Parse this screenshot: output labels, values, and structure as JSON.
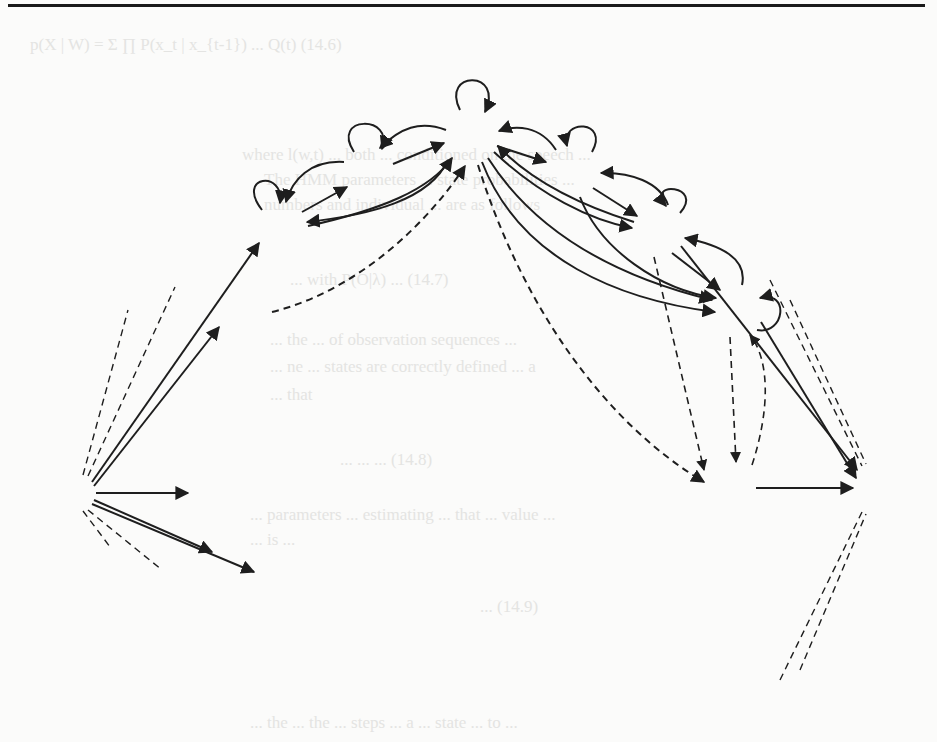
{
  "figure": {
    "nodes": [
      {
        "id": "qI",
        "label": "q",
        "sub": "I",
        "kind": "initial",
        "cx": 70,
        "cy": 493,
        "r": 22
      },
      {
        "id": "xk-1",
        "label": "x",
        "sub": "k-1",
        "kind": "state",
        "cx": 282,
        "cy": 228,
        "r": 26
      },
      {
        "id": "xk",
        "label": "x",
        "sub": "k",
        "kind": "state",
        "cx": 369,
        "cy": 172,
        "r": 26
      },
      {
        "id": "x1",
        "label": "x",
        "sub": "1",
        "kind": "state",
        "cx": 472,
        "cy": 137,
        "r": 27
      },
      {
        "id": "x2",
        "label": "x",
        "sub": "2",
        "kind": "state",
        "cx": 574,
        "cy": 172,
        "r": 26
      },
      {
        "id": "x3",
        "label": "x",
        "sub": "3",
        "kind": "state",
        "cx": 659,
        "cy": 231,
        "r": 26
      },
      {
        "id": "x4",
        "label": "x",
        "sub": "4",
        "kind": "state",
        "cx": 737,
        "cy": 311,
        "r": 26
      },
      {
        "id": "qF",
        "label": "q",
        "sub": "F",
        "kind": "final",
        "cx": 878,
        "cy": 488,
        "r": 23
      }
    ],
    "ghost_nodes": [
      {
        "cx": 246,
        "cy": 318,
        "r": 26
      },
      {
        "cx": 216,
        "cy": 410,
        "r": 26
      },
      {
        "cx": 241,
        "cy": 494,
        "r": 26
      },
      {
        "cx": 285,
        "cy": 580,
        "r": 26
      },
      {
        "cx": 365,
        "cy": 644,
        "r": 26
      },
      {
        "cx": 475,
        "cy": 680,
        "r": 26
      },
      {
        "cx": 573,
        "cy": 644,
        "r": 26
      },
      {
        "cx": 711,
        "cy": 582,
        "r": 26
      },
      {
        "cx": 730,
        "cy": 488,
        "r": 26
      }
    ],
    "labels": {
      "p_x1_x1": {
        "P": "P",
        "sub": "(x₁|x₁)"
      },
      "p_x1_x2": {
        "P": "P",
        "sub": "(x₁|x₂)"
      },
      "p_x2_x2": {
        "P": "P",
        "sub": "(x₂|x₂)"
      },
      "p_xk-1_q1": {
        "P": "P",
        "sub": "(xₖ₋₁|q1)"
      },
      "p_qF_x3": {
        "P": "P",
        "sub": "(qF|x₃)"
      }
    }
  },
  "bleed_text": [
    "where l(w, t) are both the conditioned on the speech...",
    "The HMM parameters ... the state probabilities",
    "number of ... unknown ... are as follows",
    "... the number of observations ...",
    "... states are correctly defined ...",
    "... the ... that",
    "... parameters ... estimating ... that ...",
    "... is ..."
  ]
}
